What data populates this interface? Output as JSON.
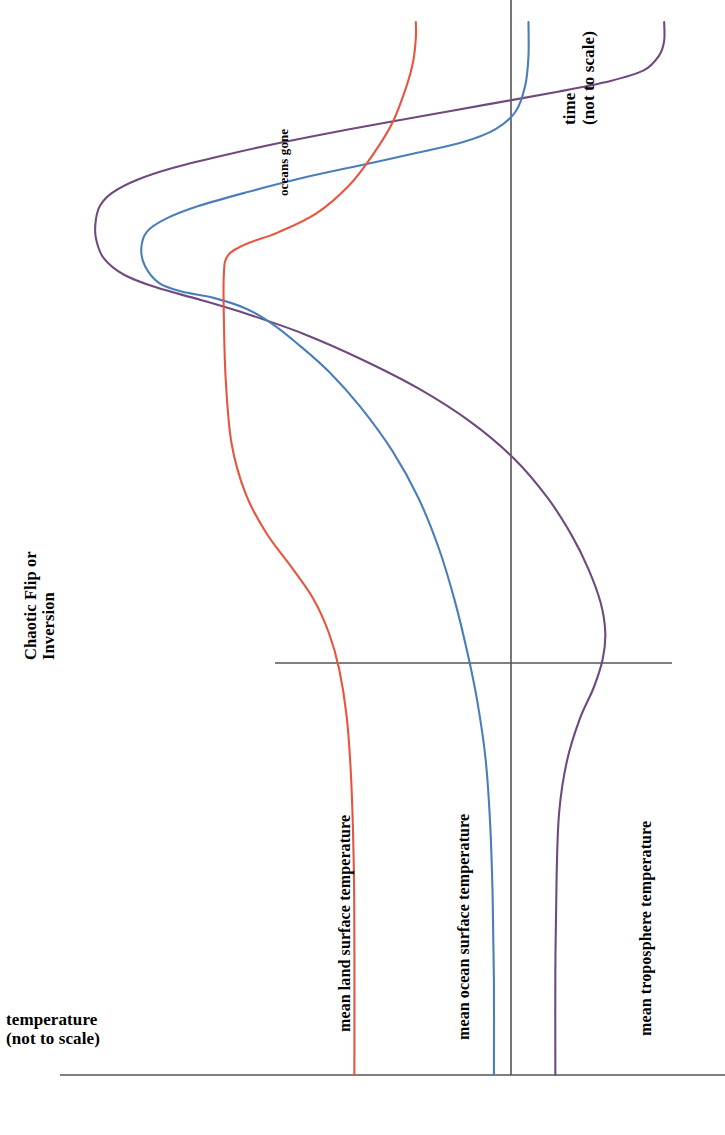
{
  "figure": {
    "title": "",
    "background_color": "#ffffff",
    "width": 725,
    "height": 1135
  },
  "axes": {
    "x_axis_label": "temperature\n(not to scale)",
    "x_axis_label_line1": "temperature",
    "x_axis_label_line2": "(not to scale)",
    "y_axis_label_line1": "time",
    "y_axis_label_line2": "(not to scale)",
    "axis_color": "#555555"
  },
  "annotations": {
    "chaotic_line1": "Chaotic Flip or",
    "chaotic_line2": "Inversion",
    "oceans_gone": "oceans gone"
  },
  "series_labels": {
    "land": "mean land surface temperature",
    "ocean": "mean ocean surface temperature",
    "troposphere": "mean troposphere temperature"
  },
  "colors": {
    "land": "#e8553f",
    "ocean": "#4a7ebb",
    "troposphere": "#6f4a7d",
    "axis": "#555555",
    "text": "#000000"
  },
  "chart_data": {
    "type": "line",
    "title": "",
    "xlabel": "temperature (not to scale)",
    "ylabel": "time (not to scale)",
    "orientation": "time on vertical axis increasing upward, temperature on horizontal axis increasing rightward",
    "grid": false,
    "legend": "inline curve labels",
    "xlim": [
      0,
      1
    ],
    "ylim": [
      0,
      1
    ],
    "annotations": [
      {
        "text": "Chaotic Flip or Inversion",
        "x": 0.05,
        "y": 0.47,
        "rotation": 90
      },
      {
        "text": "oceans gone",
        "x": 0.39,
        "y": 0.87,
        "rotation": 90
      },
      {
        "text": "time (not to scale)",
        "x": 0.76,
        "y": 0.92,
        "rotation": 90
      },
      {
        "text": "temperature (not to scale)",
        "x": 0.02,
        "y": 0.07,
        "rotation": 0
      }
    ],
    "reference_lines": [
      {
        "type": "vline",
        "x": 0.677,
        "label": "present-day reference temperature",
        "color": "#555555"
      },
      {
        "type": "hline",
        "y": 0.388,
        "label": "chaotic flip / inversion onset time",
        "color": "#555555"
      },
      {
        "type": "hline",
        "y": 0.0,
        "label": "temperature axis",
        "color": "#555555"
      }
    ],
    "series": [
      {
        "name": "mean land surface temperature",
        "color": "#e8553f",
        "points": [
          [
            0.46,
            0.0
          ],
          [
            0.46,
            0.12
          ],
          [
            0.459,
            0.2
          ],
          [
            0.455,
            0.28
          ],
          [
            0.448,
            0.34
          ],
          [
            0.436,
            0.386
          ],
          [
            0.42,
            0.42
          ],
          [
            0.396,
            0.452
          ],
          [
            0.362,
            0.482
          ],
          [
            0.322,
            0.515
          ],
          [
            0.29,
            0.552
          ],
          [
            0.268,
            0.6
          ],
          [
            0.259,
            0.66
          ],
          [
            0.256,
            0.72
          ],
          [
            0.256,
            0.76
          ],
          [
            0.262,
            0.778
          ],
          [
            0.29,
            0.789
          ],
          [
            0.34,
            0.8
          ],
          [
            0.4,
            0.818
          ],
          [
            0.452,
            0.845
          ],
          [
            0.49,
            0.875
          ],
          [
            0.52,
            0.905
          ],
          [
            0.542,
            0.94
          ],
          [
            0.552,
            0.963
          ],
          [
            0.556,
            0.985
          ],
          [
            0.556,
            1.0
          ]
        ]
      },
      {
        "name": "mean ocean surface temperature",
        "color": "#4a7ebb",
        "points": [
          [
            0.678,
            0.0
          ],
          [
            0.678,
            0.09
          ],
          [
            0.676,
            0.17
          ],
          [
            0.672,
            0.24
          ],
          [
            0.665,
            0.3
          ],
          [
            0.652,
            0.355
          ],
          [
            0.637,
            0.4
          ],
          [
            0.617,
            0.45
          ],
          [
            0.592,
            0.5
          ],
          [
            0.56,
            0.548
          ],
          [
            0.52,
            0.592
          ],
          [
            0.47,
            0.634
          ],
          [
            0.42,
            0.668
          ],
          [
            0.372,
            0.694
          ],
          [
            0.33,
            0.714
          ],
          [
            0.29,
            0.728
          ],
          [
            0.24,
            0.738
          ],
          [
            0.19,
            0.744
          ],
          [
            0.155,
            0.752
          ],
          [
            0.133,
            0.768
          ],
          [
            0.127,
            0.785
          ],
          [
            0.136,
            0.801
          ],
          [
            0.165,
            0.813
          ],
          [
            0.215,
            0.825
          ],
          [
            0.29,
            0.838
          ],
          [
            0.38,
            0.852
          ],
          [
            0.47,
            0.864
          ],
          [
            0.56,
            0.876
          ],
          [
            0.63,
            0.886
          ],
          [
            0.68,
            0.898
          ],
          [
            0.712,
            0.915
          ],
          [
            0.727,
            0.94
          ],
          [
            0.732,
            0.968
          ],
          [
            0.732,
            1.0
          ]
        ]
      },
      {
        "name": "mean troposphere temperature",
        "color": "#6f4a7d",
        "points": [
          [
            0.774,
            0.0
          ],
          [
            0.774,
            0.1
          ],
          [
            0.776,
            0.19
          ],
          [
            0.78,
            0.25
          ],
          [
            0.792,
            0.298
          ],
          [
            0.812,
            0.338
          ],
          [
            0.834,
            0.368
          ],
          [
            0.848,
            0.395
          ],
          [
            0.852,
            0.42
          ],
          [
            0.845,
            0.448
          ],
          [
            0.826,
            0.48
          ],
          [
            0.8,
            0.512
          ],
          [
            0.762,
            0.548
          ],
          [
            0.71,
            0.585
          ],
          [
            0.642,
            0.62
          ],
          [
            0.56,
            0.652
          ],
          [
            0.47,
            0.68
          ],
          [
            0.38,
            0.704
          ],
          [
            0.296,
            0.722
          ],
          [
            0.22,
            0.736
          ],
          [
            0.15,
            0.748
          ],
          [
            0.1,
            0.76
          ],
          [
            0.068,
            0.776
          ],
          [
            0.056,
            0.795
          ],
          [
            0.056,
            0.812
          ],
          [
            0.063,
            0.826
          ],
          [
            0.082,
            0.838
          ],
          [
            0.12,
            0.85
          ],
          [
            0.18,
            0.862
          ],
          [
            0.26,
            0.874
          ],
          [
            0.35,
            0.886
          ],
          [
            0.45,
            0.898
          ],
          [
            0.56,
            0.91
          ],
          [
            0.67,
            0.922
          ],
          [
            0.78,
            0.934
          ],
          [
            0.86,
            0.944
          ],
          [
            0.912,
            0.954
          ],
          [
            0.936,
            0.968
          ],
          [
            0.944,
            0.982
          ],
          [
            0.944,
            1.0
          ]
        ]
      }
    ]
  }
}
